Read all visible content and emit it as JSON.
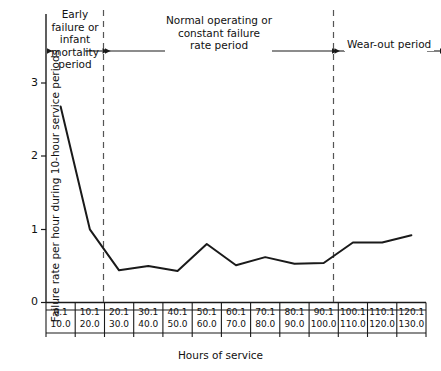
{
  "chart_data": {
    "type": "line",
    "title": "",
    "xlabel": "Hours of service",
    "ylabel": "Failure rate per hour during 10-hour service periods",
    "ylim": [
      0,
      3.4
    ],
    "yticks": [
      0,
      1,
      2,
      3
    ],
    "ytick_labels": [
      "0",
      "1",
      "2",
      "3"
    ],
    "grid": false,
    "legend": null,
    "categories": [
      "0.1\n10.0",
      "10.1\n20.0",
      "20.1\n30.0",
      "30.1\n40.0",
      "40.1\n50.0",
      "50.1\n60.0",
      "60.1\n70.0",
      "70.1\n80.0",
      "80.1\n90.0",
      "90.1\n100.0",
      "100.1\n110.0",
      "110.1\n120.0",
      "120.1\n130.0"
    ],
    "x_cells": [
      {
        "top": "0.1",
        "bottom": "10.0"
      },
      {
        "top": "10.1",
        "bottom": "20.0"
      },
      {
        "top": "20.1",
        "bottom": "30.0"
      },
      {
        "top": "30.1",
        "bottom": "40.0"
      },
      {
        "top": "40.1",
        "bottom": "50.0"
      },
      {
        "top": "50.1",
        "bottom": "60.0"
      },
      {
        "top": "60.1",
        "bottom": "70.0"
      },
      {
        "top": "70.1",
        "bottom": "80.0"
      },
      {
        "top": "80.1",
        "bottom": "90.0"
      },
      {
        "top": "90.1",
        "bottom": "100.0"
      },
      {
        "top": "100.1",
        "bottom": "110.0"
      },
      {
        "top": "110.1",
        "bottom": "120.0"
      },
      {
        "top": "120.1",
        "bottom": "130.0"
      }
    ],
    "values": [
      2.68,
      1.0,
      0.44,
      0.5,
      0.43,
      0.8,
      0.51,
      0.62,
      0.53,
      0.54,
      0.82,
      0.82,
      0.92
    ],
    "series": [
      {
        "name": "failure rate",
        "color": "#1a1a1a",
        "values": [
          2.68,
          1.0,
          0.44,
          0.5,
          0.43,
          0.8,
          0.51,
          0.62,
          0.53,
          0.54,
          0.82,
          0.82,
          0.92
        ]
      }
    ],
    "region_dividers": [
      1.5,
      9.5
    ],
    "annotations": [
      {
        "id": "early",
        "lines": [
          "Early",
          "failure or",
          "infant",
          "mortality",
          "period"
        ],
        "text": "Early failure or infant mortality period",
        "arrow": "both"
      },
      {
        "id": "normal",
        "lines": [
          "Normal operating or",
          "constant failure",
          "rate period"
        ],
        "text": "Normal operating or constant failure rate period",
        "arrow": "both"
      },
      {
        "id": "wearout",
        "lines": [
          "Wear-out period"
        ],
        "text": "Wear-out period",
        "arrow": "both"
      }
    ]
  },
  "axis": {
    "x_title": "Hours of service",
    "y_title": "Failure rate per hour during 10-hour service periods",
    "y_ticks": [
      "3",
      "2",
      "1",
      "0"
    ]
  },
  "annotations": {
    "early": {
      "line1": "Early",
      "line2": "failure or",
      "line3": "infant",
      "line4": "mortality",
      "line5": "period"
    },
    "normal": {
      "line1": "Normal operating or",
      "line2": "constant failure",
      "line3": "rate period"
    },
    "wearout": {
      "line1": "Wear-out period"
    }
  },
  "colors": {
    "line": "#1a1a1a",
    "axis": "#1a1a1a",
    "divider": "#555555",
    "background": "#ffffff"
  }
}
